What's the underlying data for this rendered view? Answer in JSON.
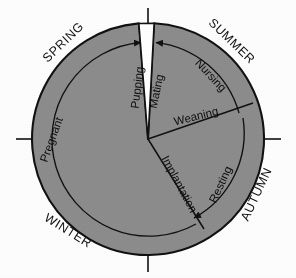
{
  "figure": {
    "type": "annual-cycle-wheel",
    "background_color": "#fdfdfd",
    "wheel_fill": "#8c8c8c",
    "stroke_color": "#111111",
    "gap_fill": "#ffffff",
    "center": {
      "x": 148,
      "y": 139
    },
    "outer_radius": 116,
    "inner_arc_radius": 97
  },
  "seasons": [
    {
      "name": "SPRING",
      "rotation": -44,
      "x": 66,
      "y": 45
    },
    {
      "name": "SUMMER",
      "rotation": 44,
      "x": 229,
      "y": 44
    },
    {
      "name": "AUTUMN",
      "rotation": -65,
      "x": 259,
      "y": 195
    },
    {
      "name": "WINTER",
      "rotation": 32,
      "x": 66,
      "y": 233
    }
  ],
  "season_ticks": [
    {
      "name": "tick-north",
      "x1": 148,
      "y1": 8,
      "x2": 148,
      "y2": 26
    },
    {
      "name": "tick-east",
      "x1": 256,
      "y1": 139,
      "x2": 280,
      "y2": 139
    },
    {
      "name": "tick-south",
      "x1": 148,
      "y1": 252,
      "x2": 148,
      "y2": 272
    },
    {
      "name": "tick-west",
      "x1": 16,
      "y1": 139,
      "x2": 40,
      "y2": 139
    }
  ],
  "phases": [
    {
      "name": "Pupping",
      "rotation": -83,
      "x": 144,
      "y": 86,
      "anchor": "middle"
    },
    {
      "name": "Mating",
      "rotation": -78,
      "x": 162,
      "y": 90,
      "anchor": "middle"
    },
    {
      "name": "Weaning",
      "rotation": -14,
      "x": 196,
      "y": 120,
      "anchor": "middle"
    },
    {
      "name": "Implantation",
      "rotation": 62,
      "x": 176,
      "y": 186,
      "anchor": "middle"
    },
    {
      "name": "Resting",
      "rotation": -65,
      "x": 223,
      "y": 186,
      "anchor": "middle"
    },
    {
      "name": "Nursing",
      "rotation": 47,
      "x": 207,
      "y": 77,
      "anchor": "middle"
    },
    {
      "name": "Pregnant",
      "rotation": -70,
      "x": 55,
      "y": 140,
      "anchor": "middle"
    }
  ],
  "spokes": [
    {
      "name": "spoke-weaning-resting",
      "x1": 148,
      "y1": 139,
      "x2": 253,
      "y2": 103
    },
    {
      "name": "spoke-implantation-lower",
      "x1": 148,
      "y1": 139,
      "x2": 204,
      "y2": 229
    }
  ],
  "gap_wedge": {
    "name": "pupping-mating-gap",
    "start_angle_deg": -94.5,
    "end_angle_deg": -87.0
  },
  "direction_arcs": [
    {
      "name": "arc-pupping-pregnant",
      "note": "counter-clockwise long arc ending at top-left of gap"
    },
    {
      "name": "arc-nursing-weaning",
      "note": "clockwise arc from gap to weaning spoke"
    },
    {
      "name": "arc-resting",
      "note": "clockwise arc from weaning spoke to implantation spoke"
    }
  ]
}
